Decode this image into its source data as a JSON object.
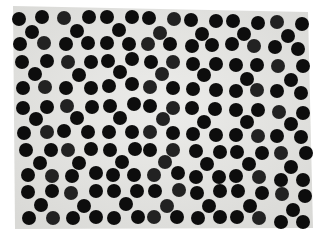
{
  "image": {
    "kind": "photograph",
    "subject": "Perforated sheet / dot pattern with black circular holes in staggered rows on a light gray background",
    "dot_color": "#111111",
    "sheet_color": "#e4e4e2",
    "surround_color": "#ffffff",
    "dot_count": 203,
    "row_count": 21
  }
}
